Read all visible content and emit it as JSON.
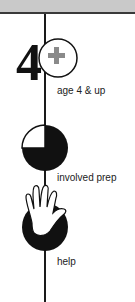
{
  "colors": {
    "topbar": "#c9c9c9",
    "line": "#1a1a1a",
    "icon_dark": "#111111",
    "plus_gray": "#8a8a8a"
  },
  "steps": [
    {
      "icon": "age-4-plus-icon",
      "label": "age 4 & up"
    },
    {
      "icon": "three-quarter-pie-icon",
      "label": "involved prep"
    },
    {
      "icon": "hand-help-icon",
      "label": "help"
    }
  ]
}
